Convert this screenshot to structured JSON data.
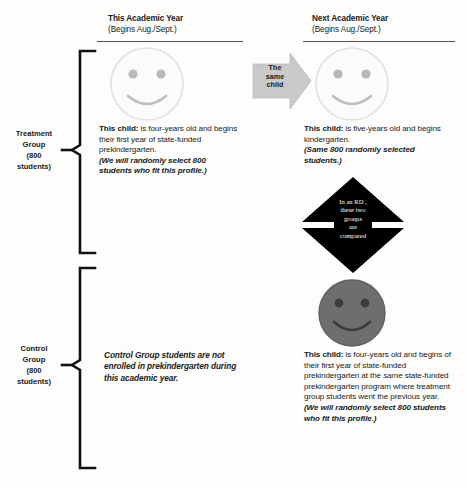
{
  "headers": [
    {
      "title": "This Academic Year",
      "subtitle": "(Begins Aug./Sept.)"
    },
    {
      "title": "Next Academic Year",
      "subtitle": "(Begins Aug./Sept.)"
    }
  ],
  "groups": [
    {
      "name": "Treatment\nGroup\n(800\nstudents)",
      "line1": "Treatment",
      "line2": "Group",
      "line3": "(800",
      "line4": "students)"
    },
    {
      "name": "Control\nGroup\n(800\nstudents)",
      "line1": "Control",
      "line2": "Group",
      "line3": "(800",
      "line4": "students)"
    }
  ],
  "treatment": {
    "this_year": {
      "lead": "This child:",
      "body": " is four-years old and begins their first year of state-funded prekindergarten.",
      "note": "(We will randomly select 800 students who fit this profile.)"
    },
    "next_year": {
      "lead": "This child:",
      "body": " is five-years old and begins kindergarten.",
      "note": "(Same 800 randomly selected students.)"
    }
  },
  "control": {
    "this_year": {
      "statement": "Control Group students are not enrolled in prekindergarten during this academic year."
    },
    "next_year": {
      "lead": "This child:",
      "body_1": " is four-years old and begins of their first year of state-funded prekindergarten at the ",
      "body_em": "same",
      "body_2": " state-funded prekindergarten program where treatment group students went the previous year.",
      "note": "(We will randomly select 800 students who fit this profile.)"
    }
  },
  "shapes": {
    "same_child_arrow": {
      "label_l1": "The",
      "label_l2": "same",
      "label_l3": "child",
      "fill": "#c9c9c9"
    },
    "compare_diamond": {
      "label_l1": "In an RD ,",
      "label_l2": "these two",
      "label_l3": "groups",
      "label_l4": "are",
      "label_l5": "compared",
      "fill": "#000000",
      "text_color": "#ffffff"
    },
    "faces": [
      {
        "name": "treatment-this-year-face",
        "fill": "#fbfbfb",
        "stroke": "#dcdcdc",
        "feature": "#b6b6b6"
      },
      {
        "name": "treatment-next-year-face",
        "fill": "#fbfbfb",
        "stroke": "#dcdcdc",
        "feature": "#b6b6b6"
      },
      {
        "name": "control-next-year-face",
        "fill": "#6e6e6e",
        "stroke": "#5c5c5c",
        "feature": "#3a3a3a"
      }
    ]
  },
  "colors": {
    "background": "#fdfdfc",
    "text": "#1a1a1a",
    "rule": "#555555",
    "brace": "#111111"
  }
}
